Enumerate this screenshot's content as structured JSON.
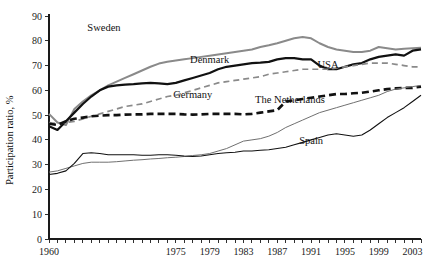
{
  "chart_data": {
    "type": "line",
    "title": "",
    "subtitle": "",
    "xlabel": "",
    "ylabel": "Participation ratio, %",
    "xlim": [
      1960,
      2004
    ],
    "ylim": [
      0,
      90
    ],
    "y_ticks": [
      0,
      10,
      20,
      30,
      40,
      50,
      60,
      70,
      80,
      90
    ],
    "y_tick_labels": [
      "0",
      "10",
      "20",
      "30",
      "40",
      "50",
      "60",
      "70",
      "80",
      "90"
    ],
    "x_ticks": [
      1960,
      1961,
      1962,
      1963,
      1964,
      1965,
      1966,
      1967,
      1968,
      1969,
      1970,
      1971,
      1972,
      1973,
      1974,
      1975,
      1976,
      1977,
      1978,
      1979,
      1980,
      1981,
      1982,
      1983,
      1984,
      1985,
      1986,
      1987,
      1988,
      1989,
      1990,
      1991,
      1992,
      1993,
      1994,
      1995,
      1996,
      1997,
      1998,
      1999,
      2000,
      2001,
      2002,
      2003,
      2004
    ],
    "x_tick_labels": [
      "1960",
      "1975",
      "1979",
      "1983",
      "1987",
      "1991",
      "1995",
      "1999",
      "2003"
    ],
    "x_labeled_ticks": [
      1960,
      1975,
      1979,
      1983,
      1987,
      1991,
      1995,
      1999,
      2003
    ],
    "grid": false,
    "legend": "inline-annotations",
    "legend_position": "inline",
    "series": [
      {
        "name": "Sweden",
        "style": "solid",
        "color": "#8a8a8a",
        "width": 2.0,
        "label_x": 1966.5,
        "label_y": 84.0,
        "x": [
          1960,
          1961,
          1962,
          1963,
          1964,
          1965,
          1966,
          1967,
          1968,
          1969,
          1970,
          1971,
          1972,
          1973,
          1974,
          1975,
          1976,
          1977,
          1978,
          1979,
          1980,
          1981,
          1982,
          1983,
          1984,
          1985,
          1986,
          1987,
          1988,
          1989,
          1990,
          1991,
          1992,
          1993,
          1994,
          1995,
          1996,
          1997,
          1998,
          1999,
          2000,
          2001,
          2002,
          2003,
          2004
        ],
        "values": [
          50.5,
          47.0,
          46.0,
          52.5,
          55.5,
          58.0,
          60.0,
          62.0,
          63.5,
          65.0,
          66.5,
          68.0,
          69.5,
          70.8,
          71.5,
          72.0,
          72.5,
          73.0,
          73.5,
          74.0,
          74.5,
          75.0,
          75.5,
          76.0,
          76.5,
          77.5,
          78.2,
          79.0,
          80.0,
          81.0,
          81.5,
          81.0,
          79.0,
          77.5,
          76.5,
          76.0,
          75.5,
          75.5,
          76.0,
          77.5,
          77.0,
          76.5,
          76.8,
          77.0,
          77.2
        ]
      },
      {
        "name": "Denmark",
        "style": "solid",
        "color": "#111111",
        "width": 2.2,
        "label_x": 1979.0,
        "label_y": 71.0,
        "x": [
          1960,
          1961,
          1962,
          1963,
          1964,
          1965,
          1966,
          1967,
          1968,
          1969,
          1970,
          1971,
          1972,
          1973,
          1974,
          1975,
          1976,
          1977,
          1978,
          1979,
          1980,
          1981,
          1982,
          1983,
          1984,
          1985,
          1986,
          1987,
          1988,
          1989,
          1990,
          1991,
          1992,
          1993,
          1994,
          1995,
          1996,
          1997,
          1998,
          1999,
          2000,
          2001,
          2002,
          2003,
          2004
        ],
        "values": [
          45.5,
          44.0,
          47.5,
          51.0,
          54.5,
          57.5,
          60.0,
          61.5,
          62.0,
          62.3,
          62.5,
          62.8,
          63.0,
          62.8,
          62.5,
          63.0,
          64.0,
          65.0,
          66.0,
          67.0,
          68.5,
          69.5,
          70.0,
          70.5,
          71.0,
          71.2,
          71.5,
          72.5,
          73.0,
          73.0,
          72.5,
          72.5,
          70.0,
          68.5,
          68.5,
          69.5,
          70.5,
          71.0,
          72.5,
          73.5,
          74.0,
          74.5,
          74.0,
          76.0,
          76.5
        ]
      },
      {
        "name": "USA",
        "style": "dashed-thin",
        "color": "#8a8a8a",
        "width": 1.7,
        "dash": "6,4",
        "label_x": 1993.0,
        "label_y": 69.0,
        "x": [
          1960,
          1961,
          1962,
          1963,
          1964,
          1965,
          1966,
          1967,
          1968,
          1969,
          1970,
          1971,
          1972,
          1973,
          1974,
          1975,
          1976,
          1977,
          1978,
          1979,
          1980,
          1981,
          1982,
          1983,
          1984,
          1985,
          1986,
          1987,
          1988,
          1989,
          1990,
          1991,
          1992,
          1993,
          1994,
          1995,
          1996,
          1997,
          1998,
          1999,
          2000,
          2001,
          2002,
          2003,
          2004
        ],
        "values": [
          47.0,
          46.5,
          47.0,
          47.5,
          48.5,
          49.5,
          50.5,
          51.5,
          52.5,
          53.5,
          54.0,
          54.5,
          55.5,
          56.5,
          57.5,
          58.0,
          59.0,
          60.0,
          61.0,
          62.0,
          63.0,
          63.5,
          64.0,
          64.5,
          65.0,
          65.5,
          66.5,
          67.0,
          67.5,
          68.0,
          68.5,
          68.5,
          68.5,
          68.5,
          69.0,
          69.5,
          70.0,
          70.5,
          71.0,
          71.0,
          71.0,
          70.5,
          70.0,
          69.5,
          69.5
        ]
      },
      {
        "name": "Germany",
        "style": "dashed-thick",
        "color": "#111111",
        "width": 2.6,
        "dash": "7,4",
        "label_x": 1977.0,
        "label_y": 57.0,
        "x": [
          1960,
          1961,
          1962,
          1963,
          1964,
          1965,
          1966,
          1967,
          1968,
          1969,
          1970,
          1971,
          1972,
          1973,
          1974,
          1975,
          1976,
          1977,
          1978,
          1979,
          1980,
          1981,
          1982,
          1983,
          1984,
          1985,
          1986,
          1987,
          1988,
          1989,
          1990,
          1991,
          1992,
          1993,
          1994,
          1995,
          1996,
          1997,
          1998,
          1999,
          2000,
          2001,
          2002,
          2003,
          2004
        ],
        "values": [
          46.5,
          46.0,
          47.5,
          48.5,
          49.0,
          49.5,
          49.8,
          50.0,
          50.0,
          50.2,
          50.3,
          50.3,
          50.5,
          50.5,
          50.5,
          50.5,
          50.3,
          50.2,
          50.3,
          50.5,
          50.5,
          50.5,
          50.5,
          50.3,
          50.5,
          51.0,
          51.5,
          52.0,
          55.5,
          56.0,
          56.5,
          57.0,
          57.5,
          58.0,
          58.5,
          58.5,
          58.8,
          59.0,
          59.5,
          60.0,
          60.5,
          60.8,
          61.0,
          61.0,
          61.5
        ]
      },
      {
        "name": "The Netherlands",
        "style": "solid-thin",
        "color": "#707070",
        "width": 1.0,
        "label_x": 1988.5,
        "label_y": 55.0,
        "x": [
          1960,
          1961,
          1962,
          1963,
          1964,
          1965,
          1966,
          1967,
          1968,
          1969,
          1970,
          1971,
          1972,
          1973,
          1974,
          1975,
          1976,
          1977,
          1978,
          1979,
          1980,
          1981,
          1982,
          1983,
          1984,
          1985,
          1986,
          1987,
          1988,
          1989,
          1990,
          1991,
          1992,
          1993,
          1994,
          1995,
          1996,
          1997,
          1998,
          1999,
          2000,
          2001,
          2002,
          2003,
          2004
        ],
        "values": [
          27.0,
          27.5,
          28.5,
          29.5,
          30.5,
          31.0,
          31.0,
          31.0,
          31.2,
          31.5,
          31.8,
          32.0,
          32.3,
          32.5,
          32.8,
          33.0,
          33.3,
          33.7,
          34.0,
          34.5,
          35.5,
          36.5,
          38.0,
          39.5,
          40.0,
          40.5,
          41.5,
          43.0,
          45.0,
          46.5,
          48.0,
          49.5,
          51.0,
          52.0,
          53.0,
          54.0,
          55.0,
          56.0,
          57.0,
          58.0,
          59.5,
          60.5,
          61.0,
          61.5,
          62.0
        ]
      },
      {
        "name": "Spain",
        "style": "solid-thin",
        "color": "#111111",
        "width": 1.1,
        "label_x": 1991.0,
        "label_y": 38.5,
        "x": [
          1960,
          1961,
          1962,
          1963,
          1964,
          1965,
          1966,
          1967,
          1968,
          1969,
          1970,
          1971,
          1972,
          1973,
          1974,
          1975,
          1976,
          1977,
          1978,
          1979,
          1980,
          1981,
          1982,
          1983,
          1984,
          1985,
          1986,
          1987,
          1988,
          1989,
          1990,
          1991,
          1992,
          1993,
          1994,
          1995,
          1996,
          1997,
          1998,
          1999,
          2000,
          2001,
          2002,
          2003,
          2004
        ],
        "values": [
          26.0,
          26.5,
          27.5,
          30.5,
          34.5,
          34.8,
          34.5,
          34.0,
          34.0,
          34.0,
          34.0,
          33.8,
          33.8,
          34.0,
          34.0,
          33.8,
          33.5,
          33.3,
          33.5,
          34.0,
          34.5,
          34.8,
          35.0,
          35.5,
          35.5,
          35.8,
          36.0,
          36.5,
          37.0,
          38.0,
          39.0,
          40.0,
          41.0,
          42.0,
          42.5,
          42.0,
          41.5,
          42.0,
          44.0,
          46.5,
          49.0,
          51.0,
          53.0,
          55.5,
          58.0
        ]
      }
    ]
  }
}
